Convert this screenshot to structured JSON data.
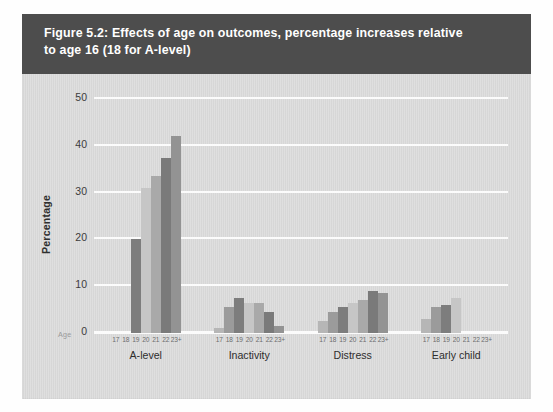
{
  "figure": {
    "title": "Figure 5.2: Effects of age on outcomes, percentage increases relative to age 16 (18 for A-level)",
    "title_line1": "Figure 5.2: Effects of age on outcomes, percentage increases relative",
    "title_line2": "to age 16 (18 for A-level)",
    "title_bar_color": "#4d4d4d",
    "plate_color": "#d9d9d9"
  },
  "axes": {
    "age_axis_label": "Age",
    "y_label": "Percentage",
    "y_ticks": [
      "0",
      "10",
      "20",
      "30",
      "40",
      "50"
    ]
  },
  "chart_data": {
    "type": "bar",
    "title": "Figure 5.2: Effects of age on outcomes, percentage increases relative to age 16 (18 for A-level)",
    "xlabel": "Age",
    "ylabel": "Percentage",
    "ylim": [
      0,
      50
    ],
    "ytick_values": [
      0,
      10,
      20,
      30,
      40,
      50
    ],
    "grid": true,
    "legend": "none",
    "grouped": true,
    "categories": [
      "17",
      "18",
      "19",
      "20",
      "21",
      "22",
      "23+"
    ],
    "groups": [
      {
        "name": "A-level",
        "values": [
          0,
          0,
          20.0,
          31.0,
          33.5,
          37.5,
          42.0
        ]
      },
      {
        "name": "Inactivity",
        "values": [
          1.0,
          5.5,
          7.5,
          6.5,
          6.5,
          4.5,
          1.5
        ]
      },
      {
        "name": "Distress",
        "values": [
          2.5,
          4.5,
          5.5,
          6.5,
          7.0,
          9.0,
          8.5
        ]
      },
      {
        "name": "Early child",
        "values": [
          3.0,
          5.5,
          6.0,
          7.5,
          0,
          0,
          0
        ]
      }
    ],
    "bar_colors": [
      "#b6b6b6",
      "#9b9b9b",
      "#7d7d7d",
      "#c6c6c6",
      "#a9a9a9",
      "#7a7a7a",
      "#939393"
    ],
    "gridline_color": "#fbfbfb",
    "plot_background": "#d9d9d9"
  }
}
